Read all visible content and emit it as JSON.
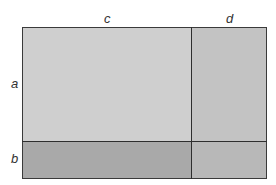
{
  "diagram": {
    "type": "area-model-rectangle",
    "labels": {
      "top_left_width": "c",
      "top_right_width": "d",
      "left_top_height": "a",
      "left_bottom_height": "b"
    },
    "regions": [
      {
        "id": "ac",
        "row": "a",
        "col": "c",
        "color": "#cfcfcf"
      },
      {
        "id": "ad",
        "row": "a",
        "col": "d",
        "color": "#c3c3c3"
      },
      {
        "id": "bc",
        "row": "b",
        "col": "c",
        "color": "#a9a9a9"
      },
      {
        "id": "bd",
        "row": "b",
        "col": "d",
        "color": "#b8b8b8"
      }
    ],
    "line_color": "#2e2e2e"
  }
}
